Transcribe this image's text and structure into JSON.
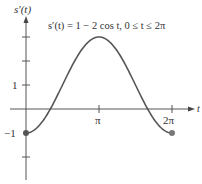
{
  "chart_data": {
    "type": "line",
    "title": "s′(t) = 1 − 2 cos t, 0 ≤ t ≤ 2π",
    "xlabel": "t",
    "ylabel": "s′(t)",
    "function": "1 - 2*cos(t)",
    "domain": [
      0,
      6.283185
    ],
    "xlim": [
      0,
      6.9
    ],
    "ylim": [
      -2.9,
      3.8
    ],
    "x_ticks": [
      {
        "value": 3.141593,
        "label": "π"
      },
      {
        "value": 6.283185,
        "label": "2π"
      }
    ],
    "y_ticks": [
      {
        "value": -2,
        "label": ""
      },
      {
        "value": -1,
        "label": "−1"
      },
      {
        "value": 1,
        "label": "1"
      },
      {
        "value": 2,
        "label": ""
      },
      {
        "value": 3,
        "label": ""
      }
    ],
    "endpoints": [
      {
        "t": 0,
        "value": -1
      },
      {
        "t": 6.283185,
        "value": -1
      }
    ],
    "sample_points": [
      {
        "t": 0,
        "value": -1
      },
      {
        "t": 1.047198,
        "value": 0
      },
      {
        "t": 1.570796,
        "value": 1
      },
      {
        "t": 3.141593,
        "value": 3
      },
      {
        "t": 4.712389,
        "value": 1
      },
      {
        "t": 5.235988,
        "value": 0
      },
      {
        "t": 6.283185,
        "value": -1
      }
    ],
    "grid": false,
    "legend": "none",
    "colors": {
      "curve": "#555555",
      "axis": "#555555",
      "point": "#555555",
      "text": "#333333"
    }
  },
  "labels": {
    "y_axis": "s′(t)",
    "x_axis": "t",
    "equation": "s′(t) = 1 − 2 cos t, 0 ≤ t ≤ 2π",
    "tick_pi": "π",
    "tick_2pi": "2π",
    "tick_1": "1",
    "tick_neg1": "−1"
  }
}
